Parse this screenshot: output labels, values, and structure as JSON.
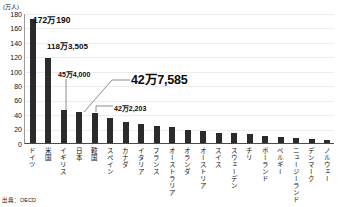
{
  "chart_data": {
    "type": "bar",
    "title": "",
    "subtitle": "",
    "xlabel": "",
    "ylabel": "(万人)",
    "unit_label": "(万人)",
    "ylim": [
      0,
      180
    ],
    "yticks": [
      180,
      160,
      140,
      120,
      100,
      80,
      60,
      40,
      20,
      0
    ],
    "grid": true,
    "legend": null,
    "source_note": "出典：OECD",
    "bar_color": "#2b2b2b",
    "categories": [
      "ドイツ",
      "米国",
      "イギリス",
      "日本",
      "韓国",
      "スペイン",
      "カナダ",
      "イタリア",
      "フランス",
      "オーストラリア",
      "オランダ",
      "オーストリア",
      "スイス",
      "スウェーデン",
      "チリ",
      "ポーランド",
      "ベルギー",
      "ニュージーランド",
      "デンマーク",
      "ノルウェー"
    ],
    "values": [
      172.0,
      118.4,
      45.4,
      42.8,
      42.2,
      35.0,
      29.5,
      26.0,
      23.5,
      21.5,
      18.0,
      16.0,
      14.0,
      14.0,
      12.5,
      10.0,
      9.0,
      7.5,
      5.5,
      4.5
    ],
    "annotations": [
      {
        "id": "anno-de",
        "label": "172万190",
        "category": "ドイツ",
        "value": 172.0
      },
      {
        "id": "anno-us",
        "label": "118万3,505",
        "category": "米国",
        "value": 118.4
      },
      {
        "id": "anno-uk",
        "label": "45万4,000",
        "category": "イギリス",
        "value": 45.4
      },
      {
        "id": "anno-jp",
        "label": "42万7,585",
        "category": "日本",
        "value": 42.8
      },
      {
        "id": "anno-kr",
        "label": "42万2,203",
        "category": "韓国",
        "value": 42.2
      }
    ]
  }
}
